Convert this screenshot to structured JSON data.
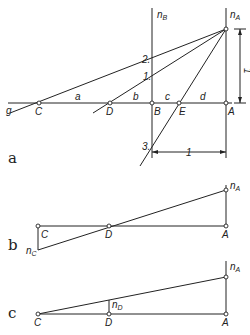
{
  "figure": {
    "panels": [
      {
        "id": "a",
        "label": "a",
        "lines": {
          "g_label": "g",
          "segment_labels": [
            "a",
            "b",
            "c",
            "d"
          ],
          "points": [
            "C",
            "D",
            "B",
            "E",
            "A"
          ],
          "verticals": [
            {
              "name": "n",
              "sub": "B"
            },
            {
              "name": "n",
              "sub": "A"
            }
          ],
          "intersections": [
            "2.",
            "1.",
            "3."
          ],
          "dimension_vertical": "1",
          "dimension_horizontal": "1"
        }
      },
      {
        "id": "b",
        "label": "b",
        "points": [
          "C",
          "D",
          "A"
        ],
        "verticals": [
          {
            "name": "n",
            "sub": "A"
          },
          {
            "name": "n",
            "sub": "C"
          }
        ]
      },
      {
        "id": "c",
        "label": "c",
        "points": [
          "C",
          "D",
          "A"
        ],
        "verticals": [
          {
            "name": "n",
            "sub": "A"
          },
          {
            "name": "n",
            "sub": "D"
          }
        ]
      }
    ]
  }
}
